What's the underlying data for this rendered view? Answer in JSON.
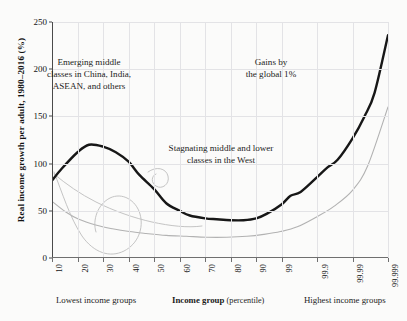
{
  "figure": {
    "background_color": "#fbfbfa",
    "axis_color": "#4a4a4a",
    "grid_color": "#e3e3e6"
  },
  "axes": {
    "ylabel": "Real income growth per adult, 1980–2016 (%)",
    "xlabel_bold": "Income group",
    "xlabel_rest": "(percentile)",
    "left_caption": "Lowest income groups",
    "right_caption": "Highest income groups"
  },
  "annotations": {
    "emerging": "Emerging middle\nclasses in China, India,\nASEAN, and others",
    "stagnating": "Stagnating middle and lower\nclasses in the West",
    "gains": "Gains by\nthe global 1%"
  },
  "chart_data": {
    "type": "line",
    "title": "",
    "xlabel": "Income group (percentile)",
    "ylabel": "Real income growth per adult, 1980–2016 (%)",
    "ylim": [
      0,
      250
    ],
    "yticks": [
      0,
      50,
      100,
      150,
      200,
      250
    ],
    "xticks": [
      "10",
      "20",
      "30",
      "40",
      "50",
      "60",
      "70",
      "80",
      "90",
      "99",
      "99.9",
      "99.99",
      "99.999"
    ],
    "xtick_positions_pct": [
      0,
      7.6,
      15.2,
      22.8,
      30.4,
      38.0,
      45.6,
      53.2,
      60.8,
      68.4,
      79.0,
      89.5,
      100.0
    ],
    "grid": true,
    "legend": "none",
    "series": [
      {
        "name": "Total real income growth (elephant curve)",
        "color": "#171717",
        "width": 2.4,
        "x_pct": [
          0,
          3,
          7.6,
          11,
          15.2,
          19,
          22.8,
          26,
          30.4,
          34,
          38,
          41,
          45.6,
          49,
          53.2,
          57,
          60.8,
          64,
          68.4,
          71,
          74,
          79,
          82,
          85,
          89.5,
          93,
          96,
          100
        ],
        "values": [
          82,
          95,
          112,
          120,
          118,
          112,
          102,
          88,
          73,
          58,
          50,
          45,
          42,
          41,
          40,
          40,
          42,
          47,
          57,
          66,
          70,
          86,
          96,
          104,
          127,
          150,
          175,
          236
        ]
      },
      {
        "name": "Secondary reference curve",
        "color": "#b2b2b2",
        "width": 1.1,
        "x_pct": [
          0,
          4,
          8,
          13,
          18,
          23,
          28,
          34,
          40,
          46,
          52,
          58,
          63,
          68,
          73,
          79,
          84,
          89.5,
          94,
          100
        ],
        "values": [
          60,
          49,
          41,
          35,
          31,
          28,
          26,
          24,
          23,
          22,
          22,
          23,
          25,
          28,
          33,
          44,
          55,
          72,
          98,
          160
        ]
      }
    ],
    "artifact_note": "faint hand-drawn pencil loop near percentiles 10–50 below 60%"
  }
}
